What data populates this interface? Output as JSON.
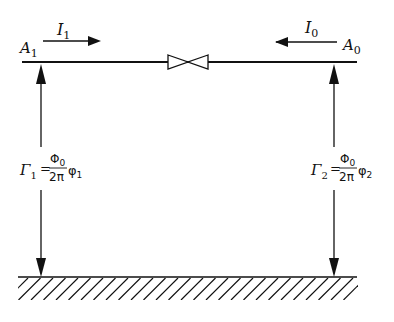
{
  "diagram": {
    "type": "josephson-junction-circuit",
    "top_line": {
      "left_node": {
        "symbol": "A",
        "sub": "1"
      },
      "right_node": {
        "symbol": "A",
        "sub": "0"
      },
      "element": "junction-valve-symbol"
    },
    "currents": [
      {
        "symbol": "I",
        "sub": "1",
        "direction": "right"
      },
      {
        "symbol": "I",
        "sub": "0",
        "direction": "left"
      }
    ],
    "left_branch": {
      "lhs": "Γ",
      "lhs_sub": "1",
      "eq": "=",
      "num": "Φ",
      "num_sub": "0",
      "den": "2π",
      "var": "φ",
      "var_sub": "1"
    },
    "right_branch": {
      "lhs": "Γ",
      "lhs_sub": "2",
      "eq": "=",
      "num": "Φ",
      "num_sub": "0",
      "den": "2π",
      "var": "φ",
      "var_sub": "2"
    },
    "ground": "hatched-ground"
  }
}
